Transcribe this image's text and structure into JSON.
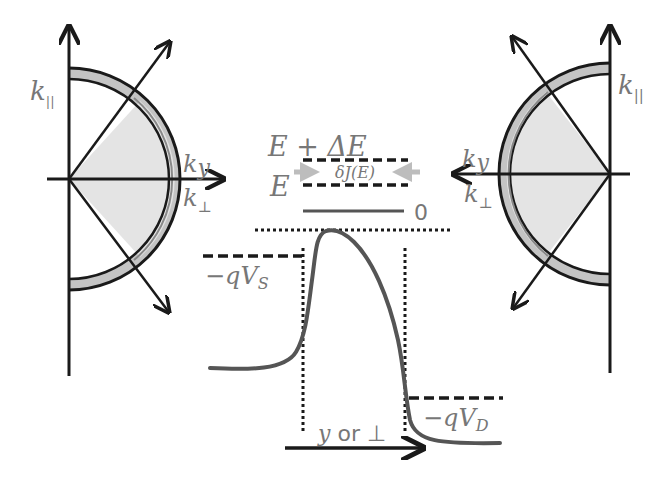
{
  "figure": {
    "colors": {
      "ink": "#1a1a1a",
      "label": "#777777",
      "curve": "#555555",
      "fill_light": "#e4e4e4",
      "fill_shell": "#c4c4c4",
      "flux_arrow": "#bdbdbd"
    }
  },
  "left_hemisphere": {
    "k_parallel_label": "k",
    "k_parallel_sub": "||",
    "k_y_label": "k",
    "k_y_sub": "y",
    "k_perp_label": "k",
    "k_perp_sub": "⊥"
  },
  "right_hemisphere": {
    "k_parallel_label": "k",
    "k_parallel_sub": "||",
    "k_y_label": "k",
    "k_y_sub": "y",
    "k_perp_label": "k",
    "k_perp_sub": "⊥"
  },
  "energy_window": {
    "upper_label": "E + ΔE",
    "lower_label": "E",
    "flux_label": "δJ(E)",
    "zero_label": "0"
  },
  "potential": {
    "source_label_prefix": "−qV",
    "source_label_sub": "S",
    "drain_label_prefix": "−qV",
    "drain_label_sub": "D"
  },
  "axis": {
    "direction_var": "y",
    "direction_or": " or ",
    "direction_perp": "⊥"
  }
}
